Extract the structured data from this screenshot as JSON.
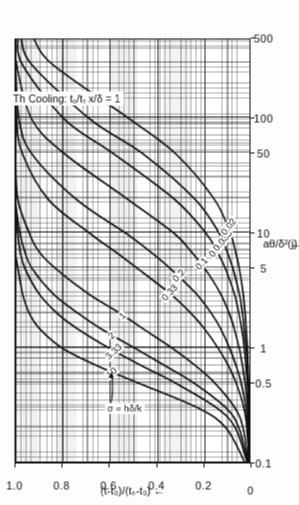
{
  "figure": {
    "panel_id": "(j)",
    "notes": [
      "Thick plate",
      "Cooling: tₒ/tₛ = 4",
      "x/δ = 1"
    ],
    "leader_label": "σ = hδ/k",
    "leader_target_curve": "10"
  },
  "axes": {
    "x": {
      "title": "aθ/δ²",
      "arrow": "←",
      "scale": "log",
      "min": 0.1,
      "max": 500,
      "ticks": [
        "0.1",
        "0.5",
        "1",
        "5",
        "10",
        "50",
        "100",
        "500"
      ],
      "tick_values": [
        0.1,
        0.5,
        1,
        5,
        10,
        50,
        100,
        500
      ]
    },
    "y": {
      "title": "(t-t₀)/(tₛ-t₀)",
      "arrow": "←",
      "scale": "linear",
      "min": 0,
      "max": 1.0,
      "ticks": [
        "0",
        "0.2",
        "0.4",
        "0.6",
        "0.8",
        "1.0"
      ],
      "tick_values": [
        0,
        0.2,
        0.4,
        0.6,
        0.8,
        1.0
      ]
    }
  },
  "chart_data": {
    "type": "line",
    "xlabel": "aθ/δ²",
    "ylabel": "(t-t₀)/(tₛ-t₀)",
    "xscale": "log",
    "yscale": "linear",
    "xlim": [
      0.1,
      500
    ],
    "ylim": [
      0,
      1.0
    ],
    "grid": true,
    "legend": "inline-curve-labels",
    "series_parameter": "σ = hδ/k",
    "series": [
      {
        "name": "10",
        "label": "10",
        "x": [
          0.1,
          0.2,
          0.3,
          0.5,
          0.7,
          1.0,
          1.5,
          2.0,
          3.0,
          5.0,
          7.0,
          10,
          20,
          50,
          100,
          300,
          500
        ],
        "y": [
          0.02,
          0.1,
          0.22,
          0.48,
          0.65,
          0.8,
          0.9,
          0.94,
          0.97,
          0.99,
          1.0,
          1.0,
          1.0,
          1.0,
          1.0,
          1.0,
          1.0
        ]
      },
      {
        "name": "3.33",
        "label": "3.33",
        "x": [
          0.1,
          0.2,
          0.3,
          0.5,
          0.7,
          1.0,
          1.5,
          2.0,
          3.0,
          5.0,
          7.0,
          10,
          20,
          50,
          100,
          300,
          500
        ],
        "y": [
          0.01,
          0.06,
          0.14,
          0.32,
          0.46,
          0.6,
          0.74,
          0.82,
          0.9,
          0.96,
          0.98,
          0.99,
          1.0,
          1.0,
          1.0,
          1.0,
          1.0
        ]
      },
      {
        "name": "2",
        "label": "2",
        "x": [
          0.1,
          0.2,
          0.3,
          0.5,
          0.7,
          1.0,
          1.5,
          2.0,
          3.0,
          5.0,
          7.0,
          10,
          20,
          50,
          100,
          300,
          500
        ],
        "y": [
          0.008,
          0.045,
          0.1,
          0.24,
          0.36,
          0.49,
          0.64,
          0.73,
          0.84,
          0.93,
          0.96,
          0.98,
          1.0,
          1.0,
          1.0,
          1.0,
          1.0
        ]
      },
      {
        "name": "1",
        "label": "1",
        "x": [
          0.1,
          0.2,
          0.3,
          0.5,
          0.7,
          1.0,
          1.5,
          2.0,
          3.0,
          5.0,
          7.0,
          10,
          20,
          50,
          100,
          300,
          500
        ],
        "y": [
          0.005,
          0.028,
          0.062,
          0.15,
          0.23,
          0.33,
          0.46,
          0.55,
          0.69,
          0.83,
          0.9,
          0.94,
          0.99,
          1.0,
          1.0,
          1.0,
          1.0
        ]
      },
      {
        "name": "0.33",
        "label": "0.33",
        "x": [
          0.1,
          0.2,
          0.3,
          0.5,
          0.7,
          1.0,
          1.5,
          2.0,
          3.0,
          5.0,
          7.0,
          10,
          20,
          50,
          100,
          300,
          500
        ],
        "y": [
          0.002,
          0.011,
          0.024,
          0.058,
          0.09,
          0.134,
          0.195,
          0.248,
          0.34,
          0.48,
          0.575,
          0.68,
          0.86,
          0.97,
          0.995,
          1.0,
          1.0
        ]
      },
      {
        "name": "0.2",
        "label": "0.2",
        "x": [
          0.1,
          0.2,
          0.3,
          0.5,
          0.7,
          1.0,
          1.5,
          2.0,
          3.0,
          5.0,
          7.0,
          10,
          20,
          50,
          100,
          300,
          500
        ],
        "y": [
          0.0012,
          0.007,
          0.015,
          0.036,
          0.057,
          0.085,
          0.125,
          0.162,
          0.228,
          0.34,
          0.425,
          0.525,
          0.74,
          0.93,
          0.985,
          1.0,
          1.0
        ]
      },
      {
        "name": "0.1",
        "label": "0.1",
        "x": [
          0.1,
          0.2,
          0.3,
          0.5,
          0.7,
          1.0,
          1.5,
          2.0,
          3.0,
          5.0,
          7.0,
          10,
          20,
          50,
          100,
          300,
          500
        ],
        "y": [
          0.0006,
          0.0035,
          0.0078,
          0.019,
          0.03,
          0.044,
          0.066,
          0.086,
          0.124,
          0.192,
          0.25,
          0.32,
          0.52,
          0.79,
          0.93,
          0.995,
          1.0
        ]
      },
      {
        "name": "0.05",
        "label": "0.05",
        "x": [
          0.1,
          0.2,
          0.3,
          0.5,
          0.7,
          1.0,
          1.5,
          2.0,
          3.0,
          5.0,
          7.0,
          10,
          20,
          50,
          100,
          300,
          500
        ],
        "y": [
          0.0003,
          0.0018,
          0.004,
          0.0097,
          0.0153,
          0.0225,
          0.034,
          0.045,
          0.065,
          0.104,
          0.139,
          0.184,
          0.32,
          0.58,
          0.79,
          0.97,
          0.99
        ]
      },
      {
        "name": "0.033",
        "label": "0.033",
        "x": [
          0.1,
          0.2,
          0.3,
          0.5,
          0.7,
          1.0,
          1.5,
          2.0,
          3.0,
          5.0,
          7.0,
          10,
          20,
          50,
          100,
          300,
          500
        ],
        "y": [
          0.0002,
          0.0012,
          0.0027,
          0.0065,
          0.0102,
          0.015,
          0.0228,
          0.03,
          0.044,
          0.071,
          0.096,
          0.128,
          0.232,
          0.455,
          0.68,
          0.93,
          0.975
        ]
      },
      {
        "name": "0.02",
        "label": "0.02",
        "x": [
          0.1,
          0.2,
          0.3,
          0.5,
          0.7,
          1.0,
          1.5,
          2.0,
          3.0,
          5.0,
          7.0,
          10,
          20,
          50,
          100,
          300,
          500
        ],
        "y": [
          0.0001,
          0.0007,
          0.0016,
          0.004,
          0.0062,
          0.0092,
          0.0139,
          0.0184,
          0.027,
          0.044,
          0.06,
          0.081,
          0.15,
          0.315,
          0.51,
          0.84,
          0.92
        ]
      }
    ]
  }
}
